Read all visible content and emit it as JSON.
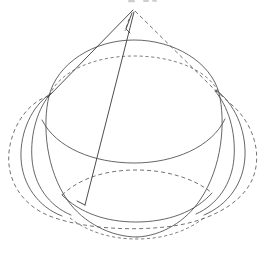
{
  "figure": {
    "title": "Cone circumscribed about a sphere",
    "kind": "geometric-line-drawing",
    "background_color": "#ffffff",
    "line_color": "#4a4a4a",
    "dashed_line_color": "#5a5a5a",
    "canvas": {
      "width": 269,
      "height": 258
    },
    "top_artifact": {
      "name": "top-edge-smudge",
      "description": "faint clipped mark at top edge",
      "x": 126,
      "y": 0,
      "width": 34,
      "height": 4
    },
    "apex": {
      "label": "apex",
      "x": 133,
      "y": 10
    },
    "tangent_points": [
      {
        "label": "left-tangent",
        "x": 49,
        "y": 96
      },
      {
        "label": "right-tangent",
        "x": 216,
        "y": 92
      }
    ],
    "elements": [
      {
        "name": "cone-left-edge",
        "type": "line",
        "style": "solid",
        "from": {
          "x": 133,
          "y": 10
        },
        "to": {
          "x": 49,
          "y": 96
        }
      },
      {
        "name": "cone-right-edge",
        "type": "line",
        "style": "dashed",
        "from": {
          "x": 135,
          "y": 11
        },
        "to": {
          "x": 217,
          "y": 92
        }
      },
      {
        "name": "cone-slant-chord",
        "type": "line",
        "style": "solid",
        "from": {
          "x": 134,
          "y": 12
        },
        "to": {
          "x": 85,
          "y": 205
        }
      },
      {
        "name": "cone-apex-notch",
        "type": "line",
        "style": "solid",
        "from": {
          "x": 131,
          "y": 13
        },
        "to": {
          "x": 127,
          "y": 27
        }
      },
      {
        "name": "sphere-upper-outline",
        "type": "arc",
        "style": "solid",
        "description": "upper silhouette arc of the sphere"
      },
      {
        "name": "sphere-lower-outline",
        "type": "arc",
        "style": "solid",
        "description": "lower silhouette arc of the sphere"
      },
      {
        "name": "sphere-equator-ellipse",
        "type": "ellipse-arc",
        "style": "solid",
        "description": "equatorial circle seen in perspective"
      },
      {
        "name": "tangent-circle-ellipse",
        "type": "ellipse",
        "style": "dashed",
        "description": "circle of tangency between cone and sphere"
      },
      {
        "name": "cone-base-ellipse",
        "type": "ellipse-arc",
        "style": "dashed",
        "description": "hidden back half of the cone base circle"
      },
      {
        "name": "lower-band-ellipse",
        "type": "ellipse-arc",
        "style": "dashed",
        "description": "lower hidden circle of the sphere"
      },
      {
        "name": "left-lobe-arc",
        "type": "arc",
        "style": "solid",
        "description": "left outer lobe of the tangent circle"
      },
      {
        "name": "right-lobe-arc",
        "type": "arc",
        "style": "solid",
        "description": "right outer lobe of the tangent circle"
      }
    ]
  }
}
